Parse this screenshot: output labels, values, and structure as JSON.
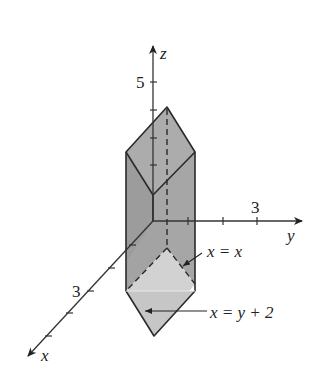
{
  "figure": {
    "colors": {
      "background": "#ffffff",
      "axis": "#333333",
      "face_dark": "#9a9a9a",
      "face_mid": "#a8a8a8",
      "face_light": "#cfcfcf",
      "edge": "#2a2a2a"
    },
    "axes": {
      "z": {
        "label": "z",
        "tick_label": "5"
      },
      "y": {
        "label": "y",
        "tick_label": "3"
      },
      "x": {
        "label": "x",
        "tick_label": "3"
      }
    },
    "annotations": [
      {
        "id": "plane-1",
        "text": "x = x"
      },
      {
        "id": "plane-2",
        "text": "x = y + 2"
      }
    ]
  }
}
